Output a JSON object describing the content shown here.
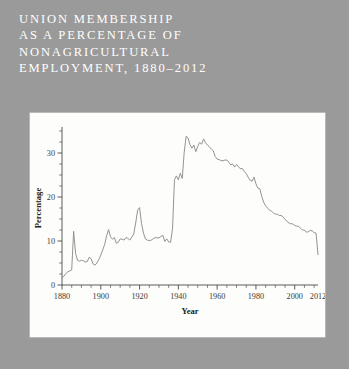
{
  "title": {
    "lines": [
      "UNION MEMBERSHIP",
      "AS A PERCENTAGE OF",
      "NONAGRICULTURAL",
      "EMPLOYMENT, 1880–2012"
    ]
  },
  "colors": {
    "background": "#9a9a9a",
    "panel": "#fdfdfb",
    "title_text": "#ffffff",
    "line": "#8d8d8d",
    "axis": "#4a4a4a"
  },
  "chart_data": {
    "type": "line",
    "xlabel": "Year",
    "ylabel": "Percentage",
    "xlim": [
      1880,
      2012
    ],
    "ylim": [
      0,
      35
    ],
    "grid": false,
    "legend": null,
    "xticks": [
      1880,
      1900,
      1920,
      1940,
      1960,
      1980,
      2000,
      2012
    ],
    "xtick_labels": [
      "1880",
      "1900",
      "1920",
      "1940",
      "1960",
      "1980",
      "2000",
      "2012"
    ],
    "xminor_step": 5,
    "yticks": [
      0,
      10,
      20,
      30
    ],
    "ytick_labels": [
      "0",
      "10",
      "20",
      "30"
    ],
    "yminor_step": 2.5,
    "x": [
      1880,
      1881,
      1882,
      1883,
      1884,
      1885,
      1886,
      1887,
      1888,
      1889,
      1890,
      1891,
      1892,
      1893,
      1894,
      1895,
      1896,
      1897,
      1898,
      1899,
      1900,
      1901,
      1902,
      1903,
      1904,
      1905,
      1906,
      1907,
      1908,
      1909,
      1910,
      1911,
      1912,
      1913,
      1914,
      1915,
      1916,
      1917,
      1918,
      1919,
      1920,
      1921,
      1922,
      1923,
      1924,
      1925,
      1926,
      1927,
      1928,
      1929,
      1930,
      1931,
      1932,
      1933,
      1934,
      1935,
      1936,
      1937,
      1938,
      1939,
      1940,
      1941,
      1942,
      1943,
      1944,
      1945,
      1946,
      1947,
      1948,
      1949,
      1950,
      1951,
      1952,
      1953,
      1954,
      1955,
      1956,
      1957,
      1958,
      1959,
      1960,
      1961,
      1962,
      1963,
      1964,
      1965,
      1966,
      1967,
      1968,
      1969,
      1970,
      1971,
      1972,
      1973,
      1974,
      1975,
      1976,
      1977,
      1978,
      1979,
      1980,
      1981,
      1982,
      1983,
      1984,
      1985,
      1986,
      1987,
      1988,
      1989,
      1990,
      1991,
      1992,
      1993,
      1994,
      1995,
      1996,
      1997,
      1998,
      1999,
      2000,
      2001,
      2002,
      2003,
      2004,
      2005,
      2006,
      2007,
      2008,
      2009,
      2010,
      2011,
      2012
    ],
    "values": [
      1.7,
      2.0,
      2.6,
      3.0,
      3.2,
      3.4,
      12.2,
      7.2,
      5.6,
      5.4,
      5.6,
      5.5,
      5.2,
      5.3,
      6.3,
      6.0,
      4.8,
      4.5,
      5.0,
      5.8,
      6.8,
      8.0,
      9.2,
      11.2,
      12.6,
      11.0,
      10.4,
      10.8,
      9.5,
      9.7,
      10.5,
      10.4,
      10.2,
      10.8,
      10.6,
      10.2,
      10.9,
      11.6,
      14.1,
      17.0,
      17.6,
      14.0,
      11.8,
      10.5,
      10.2,
      10.1,
      10.2,
      10.5,
      10.8,
      10.7,
      10.7,
      11.0,
      11.3,
      9.9,
      10.5,
      9.8,
      9.7,
      12.9,
      23.9,
      24.8,
      23.9,
      25.4,
      24.2,
      30.1,
      33.8,
      33.4,
      31.9,
      31.1,
      31.8,
      30.3,
      31.5,
      32.4,
      32.0,
      33.2,
      32.3,
      31.8,
      31.4,
      30.9,
      30.5,
      29.2,
      28.6,
      28.5,
      28.3,
      28.2,
      28.4,
      28.4,
      27.9,
      27.3,
      27.5,
      26.8,
      27.4,
      26.9,
      26.4,
      26.5,
      25.8,
      25.3,
      24.5,
      23.8,
      23.6,
      24.5,
      23.0,
      22.0,
      21.9,
      20.1,
      18.8,
      18.0,
      17.5,
      17.0,
      16.8,
      16.4,
      16.1,
      16.1,
      15.8,
      15.8,
      15.5,
      14.9,
      14.5,
      14.1,
      13.9,
      13.9,
      13.5,
      13.4,
      13.3,
      12.9,
      12.5,
      12.5,
      12.0,
      12.1,
      12.4,
      12.3,
      11.9,
      11.8,
      6.9
    ]
  }
}
